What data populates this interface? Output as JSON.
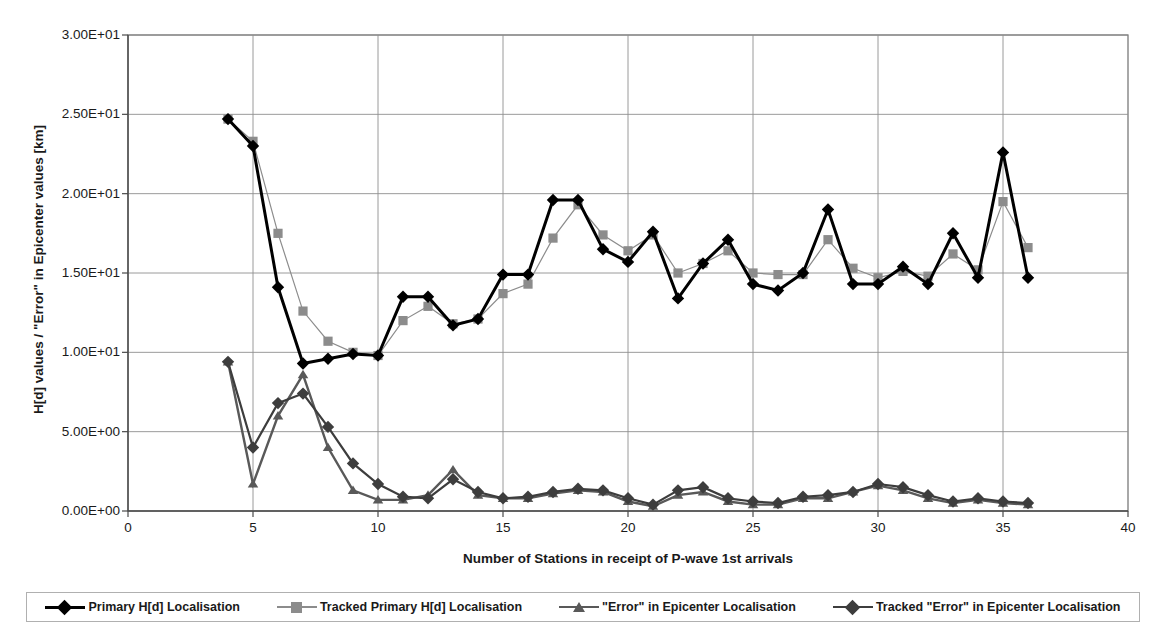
{
  "chart_data": {
    "type": "line",
    "title": "",
    "xlabel": "Number of Stations in receipt of P-wave 1st arrivals",
    "ylabel": "H[d] values / \"Error\" in Epicenter values [km]",
    "xlim": [
      0,
      40
    ],
    "ylim": [
      0,
      30
    ],
    "grid": true,
    "legend_position": "bottom",
    "xticks": [
      "0",
      "5",
      "10",
      "15",
      "20",
      "25",
      "30",
      "35",
      "40"
    ],
    "xtick_values": [
      0,
      5,
      10,
      15,
      20,
      25,
      30,
      35,
      40
    ],
    "yticks": [
      "0.00E+00",
      "5.00E+00",
      "1.00E+01",
      "1.50E+01",
      "2.00E+01",
      "2.50E+01",
      "3.00E+01"
    ],
    "ytick_values": [
      0,
      5,
      10,
      15,
      20,
      25,
      30
    ],
    "x": [
      4,
      5,
      6,
      7,
      8,
      9,
      10,
      11,
      12,
      13,
      14,
      15,
      16,
      17,
      18,
      19,
      20,
      21,
      22,
      23,
      24,
      25,
      26,
      27,
      28,
      29,
      30,
      31,
      32,
      33,
      34,
      35,
      36
    ],
    "series": [
      {
        "name": "Primary H[d] Localisation",
        "color": "#000000",
        "marker": "diamond",
        "width": 3.0,
        "values": [
          24.7,
          23.0,
          14.1,
          9.3,
          9.6,
          9.9,
          9.8,
          13.5,
          13.5,
          11.7,
          12.1,
          14.9,
          14.9,
          19.6,
          19.6,
          16.5,
          15.7,
          17.6,
          13.4,
          15.6,
          17.1,
          14.3,
          13.9,
          15.0,
          19.0,
          14.3,
          14.3,
          15.4,
          14.3,
          17.5,
          14.7,
          22.6,
          14.7
        ]
      },
      {
        "name": "Tracked Primary H[d] Localisation",
        "color": "#8c8c8c",
        "marker": "square",
        "width": 1.2,
        "values": [
          24.7,
          23.3,
          17.5,
          12.6,
          10.7,
          10.0,
          9.8,
          12.0,
          12.9,
          11.8,
          12.1,
          13.7,
          14.3,
          17.2,
          19.3,
          17.4,
          16.4,
          17.4,
          15.0,
          15.6,
          16.4,
          15.0,
          14.9,
          14.9,
          17.1,
          15.3,
          14.7,
          15.1,
          14.8,
          16.2,
          15.2,
          19.5,
          16.6
        ]
      },
      {
        "name": "\"Error\" in Epicenter Localisation",
        "color": "#595959",
        "marker": "triangle",
        "width": 2.4,
        "values": [
          9.4,
          1.7,
          6.0,
          8.6,
          4.0,
          1.3,
          0.7,
          0.7,
          1.0,
          2.6,
          1.0,
          0.8,
          0.8,
          1.1,
          1.3,
          1.2,
          0.6,
          0.3,
          1.0,
          1.2,
          0.6,
          0.4,
          0.4,
          0.8,
          0.8,
          1.2,
          1.6,
          1.3,
          0.8,
          0.5,
          0.7,
          0.5,
          0.4
        ]
      },
      {
        "name": "Tracked \"Error\" in Epicenter Localisation",
        "color": "#3d3d3d",
        "marker": "diamond",
        "width": 2.2,
        "values": [
          9.4,
          4.0,
          6.8,
          7.4,
          5.3,
          3.0,
          1.7,
          0.9,
          0.8,
          2.0,
          1.2,
          0.8,
          0.9,
          1.2,
          1.4,
          1.3,
          0.8,
          0.4,
          1.3,
          1.5,
          0.8,
          0.6,
          0.5,
          0.9,
          1.0,
          1.2,
          1.7,
          1.5,
          1.0,
          0.6,
          0.8,
          0.6,
          0.5
        ]
      }
    ]
  },
  "axis": {
    "ylabel": "H[d] values / \"Error\" in Epicenter values [km]",
    "xlabel": "Number of Stations in receipt of P-wave 1st arrivals"
  },
  "legend": {
    "items": [
      {
        "label": "Primary H[d] Localisation",
        "color": "#000000",
        "marker": "diamond"
      },
      {
        "label": "Tracked Primary H[d] Localisation",
        "color": "#8c8c8c",
        "marker": "square"
      },
      {
        "label": "\"Error\" in Epicenter Localisation",
        "color": "#595959",
        "marker": "triangle"
      },
      {
        "label": "Tracked \"Error\" in Epicenter Localisation",
        "color": "#3d3d3d",
        "marker": "diamond"
      }
    ]
  }
}
